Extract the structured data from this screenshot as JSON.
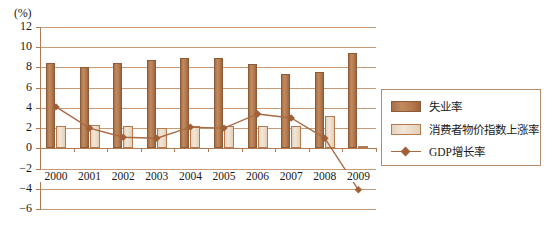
{
  "chart_data": {
    "type": "bar",
    "title": "",
    "subtitle": "",
    "xlabel": "",
    "ylabel": "(%)",
    "unit_label": "(%)",
    "ylim": [
      -6,
      12
    ],
    "yticks": [
      12,
      10,
      8,
      6,
      4,
      2,
      0,
      -2,
      -4,
      -6
    ],
    "ytick_labels": [
      "12",
      "10",
      "8",
      "6",
      "4",
      "2",
      "0",
      "−2",
      "−4",
      "−6"
    ],
    "grid": true,
    "legend_position": "right",
    "categories": [
      "2000",
      "2001",
      "2002",
      "2003",
      "2004",
      "2005",
      "2006",
      "2007",
      "2008",
      "2009"
    ],
    "series": [
      {
        "name": "失业率",
        "type": "bar",
        "color": "#b5794f",
        "values": [
          8.4,
          8.0,
          8.4,
          8.7,
          8.9,
          8.9,
          8.3,
          7.4,
          7.6,
          9.4
        ]
      },
      {
        "name": "消费者物价指数上涨率",
        "type": "bar",
        "color": "#e8d5bf",
        "values": [
          2.2,
          2.3,
          2.2,
          2.0,
          2.2,
          2.2,
          2.2,
          2.2,
          3.2,
          0.1
        ]
      },
      {
        "name": "GDP增长率",
        "type": "line",
        "color": "#a86a42",
        "marker": "diamond",
        "values": [
          4.1,
          2.0,
          1.1,
          1.0,
          2.1,
          2.0,
          3.4,
          3.0,
          1.0,
          -4.1
        ]
      }
    ]
  },
  "legend": {
    "items": [
      {
        "label": "失业率",
        "swatch": "bar-swatch-brown"
      },
      {
        "label": "消费者物价指数上涨率",
        "swatch": "bar-swatch-tan"
      },
      {
        "label": "GDP增长率",
        "swatch": "line-marker-diamond"
      }
    ]
  },
  "colors": {
    "unemployment_bar": "#b5794f",
    "cpi_bar": "#e8d5bf",
    "gdp_line": "#a86a42",
    "gridline": "#c99a76",
    "axis": "#b07a52",
    "background": "#ffffff",
    "text": "#1a1a1a"
  }
}
